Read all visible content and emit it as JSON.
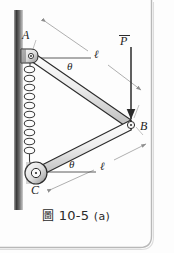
{
  "figure": {
    "caption_symbol": "圖",
    "caption_number": "10-5",
    "caption_suffix": "(a)",
    "caption_full": "圖 10-5 (a)"
  },
  "labels": {
    "joint_a": "A",
    "joint_b": "B",
    "joint_c": "C",
    "force_p": "P",
    "length_upper": "ℓ",
    "length_lower": "ℓ",
    "angle_upper": "θ",
    "angle_lower": "θ"
  },
  "elements": {
    "wall_name": "fixed-wall",
    "spring_name": "coil-spring",
    "spring_coils": 11,
    "link_ab": "link-A-B",
    "link_cb": "link-C-B",
    "pin_a": "pin-joint-A",
    "pin_b": "pin-joint-B",
    "pin_c": "pin-joint-C",
    "force_arrow": "force-arrow-P",
    "dimension_upper": "dimension-line-upper",
    "dimension_lower": "dimension-line-lower",
    "angle_line_upper": "angle-reference-line-upper",
    "angle_line_lower": "angle-reference-line-lower"
  },
  "colors": {
    "ink": "#2b2b2b",
    "link_fill": "#e9e9e9",
    "wall_dark": "#3a3a3a",
    "wall_light": "#c9c9c9",
    "dimension": "#9a9a9a",
    "border": "#b8b8b8",
    "background": "#fdfdfd"
  },
  "geometry": {
    "point_a": [
      31,
      56
    ],
    "point_b": [
      131,
      125
    ],
    "point_c": [
      36,
      173
    ],
    "force_p_tip": [
      131,
      121
    ],
    "force_p_tail": [
      131,
      47
    ]
  }
}
